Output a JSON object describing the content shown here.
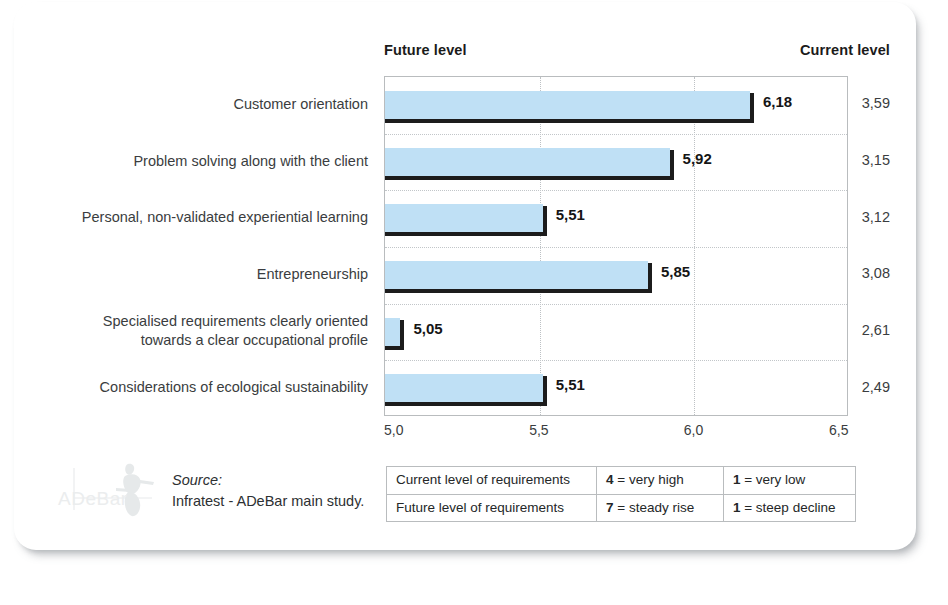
{
  "headers": {
    "future": "Future level",
    "current": "Current level"
  },
  "chart_data": {
    "type": "bar",
    "title": "",
    "subtitle": "",
    "orientation": "horizontal",
    "xlabel": "",
    "ylabel": "",
    "xlim": [
      5.0,
      6.5
    ],
    "xticks": [
      "5,0",
      "5,5",
      "6,0",
      "6,5"
    ],
    "xtick_values": [
      5.0,
      5.5,
      6.0,
      6.5
    ],
    "grid": "dotted vertical at 5,5 and 6,0; dotted horizontal row separators",
    "legend_position": "bottom-table",
    "categories": [
      "Customer orientation",
      "Problem solving along with the client",
      "Personal, non-validated experiential learning",
      "Entrepreneurship",
      "Specialised requirements clearly oriented\ntowards a clear occupational profile",
      "Considerations of ecological sustainability"
    ],
    "series": [
      {
        "name": "Future level",
        "values": [
          6.18,
          5.92,
          5.51,
          5.85,
          5.05,
          5.51
        ],
        "labels": [
          "6,18",
          "5,92",
          "5,51",
          "5,85",
          "5,05",
          "5,51"
        ],
        "color": "#bfe0f5"
      },
      {
        "name": "Current level",
        "values": [
          3.59,
          3.15,
          3.12,
          3.08,
          2.61,
          2.49
        ],
        "labels": [
          "3,59",
          "3,15",
          "3,12",
          "3,08",
          "2,61",
          "2,49"
        ],
        "rendered_as": "text column"
      }
    ]
  },
  "source": {
    "title": "Source:",
    "text": "Infratest - ADeBar main study.",
    "logo_text": "ADeBar"
  },
  "legend": {
    "rows": [
      {
        "label": "Current level of requirements",
        "high_value": "4",
        "high_text": " = very high",
        "low_value": "1",
        "low_text": " = very low"
      },
      {
        "label": "Future level of requirements",
        "high_value": "7",
        "high_text": " = steady rise",
        "low_value": "1",
        "low_text": " = steep decline"
      }
    ]
  },
  "colors": {
    "bar_fill": "#bfe0f5",
    "bar_shadow": "#1c1c1c",
    "frame": "#b9bcbe",
    "text": "#3a3d40"
  }
}
